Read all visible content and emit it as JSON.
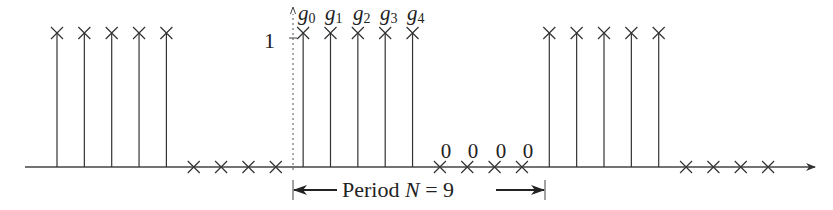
{
  "figure": {
    "type": "periodic discrete-time sequence (stem plot)",
    "y_tick_label": "1",
    "sample_labels": [
      "g",
      "g",
      "g",
      "g",
      "g"
    ],
    "sample_subscripts": [
      "0",
      "1",
      "2",
      "3",
      "4"
    ],
    "zero_labels": [
      "0",
      "0",
      "0",
      "0"
    ],
    "period_label": {
      "prefix": "Period ",
      "variable": "N",
      "equals": " = 9"
    },
    "period": 9,
    "one_period_values": [
      1,
      1,
      1,
      1,
      1,
      0,
      0,
      0,
      0
    ],
    "periods_shown": 3,
    "colors": {
      "stroke": "#333333",
      "text": "#222222",
      "background": "#ffffff"
    }
  }
}
